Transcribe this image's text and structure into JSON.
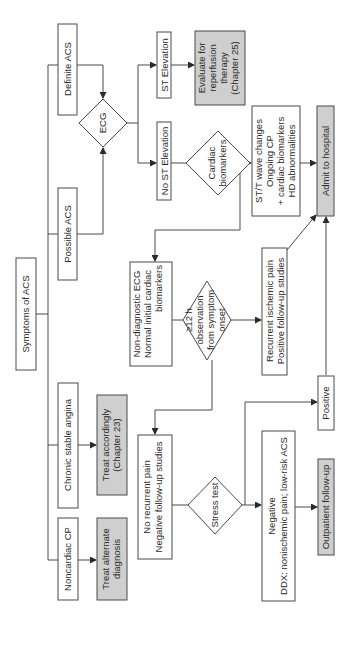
{
  "diagram": {
    "title": "Symptoms of ACS",
    "orientation": "rotated-90-ccw",
    "colors": {
      "line": "#4a4a4a",
      "box_fill": "#ffffff",
      "shaded_fill": "#cfcfcf",
      "text": "#2a2a2a"
    },
    "nodes": {
      "symptoms": {
        "lines": [
          "Symptoms of ACS"
        ]
      },
      "definite_acs": {
        "lines": [
          "Definite ACS"
        ]
      },
      "possible_acs": {
        "lines": [
          "Possible ACS"
        ]
      },
      "chronic_stable_angina": {
        "lines": [
          "Chronic stable angina"
        ]
      },
      "noncardiac_cp": {
        "lines": [
          "Noncardiac CP"
        ]
      },
      "ecg": {
        "lines": [
          "ECG"
        ]
      },
      "st_elevation": {
        "lines": [
          "ST Elevation"
        ]
      },
      "no_st_elevation": {
        "lines": [
          "No ST Elevation"
        ]
      },
      "evaluate_reperfusion": {
        "lines": [
          "Evaluate for",
          "reperfusion",
          "therapy",
          "(Chapter 25)"
        ]
      },
      "cardiac_biomarkers": {
        "lines": [
          "Cardiac",
          "biomarkers"
        ]
      },
      "st_t_changes": {
        "lines": [
          "ST/T wave changes",
          "Ongoing CP",
          "+ cardiac biomarkers",
          "HD abnormalities"
        ]
      },
      "admit_hospital": {
        "lines": [
          "Admit to hospital"
        ]
      },
      "non_diagnostic": {
        "lines": [
          "Non-diagnostic ECG",
          "Normal initial cardiac",
          "biomarkers"
        ]
      },
      "observation": {
        "lines": [
          "≥12 h",
          "observation",
          "from symptom",
          "onset"
        ]
      },
      "recurrent_pain": {
        "lines": [
          "Recurrent ischemic pain",
          "Positive follow-up studies"
        ]
      },
      "positive": {
        "lines": [
          "Positive"
        ]
      },
      "treat_accordingly": {
        "lines": [
          "Treat accordingly",
          "(Chapter 23)"
        ]
      },
      "treat_alternate": {
        "lines": [
          "Treat alternate",
          "diagnosis"
        ]
      },
      "no_recurrent_pain": {
        "lines": [
          "No recurrent pain",
          "Negative follow-up studies"
        ]
      },
      "stress_test": {
        "lines": [
          "Stress test"
        ]
      },
      "negative_ddx": {
        "lines": [
          "Negative",
          "DDX: nonischemic pain; low-risk ACS"
        ]
      },
      "outpatient": {
        "lines": [
          "Outpatient follow-up"
        ]
      }
    }
  }
}
